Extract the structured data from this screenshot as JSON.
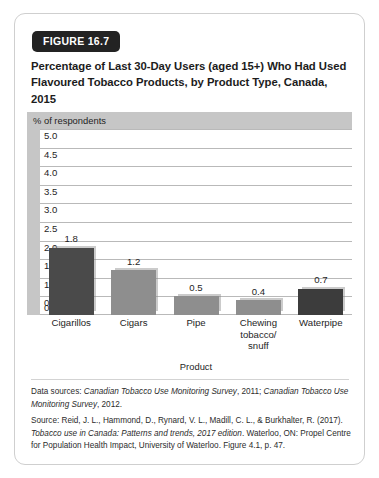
{
  "figure": {
    "badge": "FIGURE 16.7",
    "title": "Percentage of Last 30-Day Users (aged 15+) Who Had Used Flavoured Tobacco Products, by Product Type, Canada, 2015"
  },
  "footer": {
    "data_sources_prefix": "Data sources: ",
    "data_sources_italic_1": "Canadian Tobacco Use Monitoring Survey",
    "data_sources_mid_1": ", 2011; ",
    "data_sources_italic_2": "Canadian Tobacco Use Monitoring Survey",
    "data_sources_end": ", 2012.",
    "source_prefix": "Source: Reid, J. L., Hammond, D., Rynard, V. L., Madill, C. L., & Burkhalter, R. (2017). ",
    "source_italic": "Tobacco use in Canada: Patterns and trends, 2017 edition",
    "source_end": ". Waterloo, ON: Propel Centre for Population Health Impact, University of Waterloo. Figure 4.1, p. 47."
  },
  "chart_data": {
    "type": "bar",
    "title": "Percentage of Last 30-Day Users (aged 15+) Who Had Used Flavoured Tobacco Products, by Product Type, Canada, 2015",
    "axis_band_label": "% of respondents",
    "xlabel": "Product",
    "ylabel": "% of respondents",
    "ylim": [
      0.0,
      5.0
    ],
    "ytick_step": 0.5,
    "ytick_labels": [
      "5.0",
      "4.5",
      "4.0",
      "3.5",
      "3.0",
      "2.5",
      "2.0",
      "1.5",
      "1.0",
      "0.5",
      "0.0"
    ],
    "grid": true,
    "legend": "none",
    "categories": [
      "Cigarillos",
      "Cigars",
      "Pipe",
      "Chewing tobacco/ snuff",
      "Waterpipe"
    ],
    "category_lines": [
      [
        "Cigarillos"
      ],
      [
        "Cigars"
      ],
      [
        "Pipe"
      ],
      [
        "Chewing",
        "tobacco/",
        "snuff"
      ],
      [
        "Waterpipe"
      ]
    ],
    "values": [
      1.8,
      1.2,
      0.5,
      0.4,
      0.7
    ],
    "value_labels": [
      "1.8",
      "1.2",
      "0.5",
      "0.4",
      "0.7"
    ],
    "bar_colors": [
      "#4a4a4a",
      "#8e8e8e",
      "#8e8e8e",
      "#8e8e8e",
      "#3c3c3c"
    ],
    "colors": {
      "dark_bar": "#4a4a4a",
      "light_bar": "#8e8e8e",
      "band": "#c6c6c6",
      "gridline": "#b9b9b9",
      "badge": "#232323",
      "card_border": "#cfcfcf"
    }
  }
}
